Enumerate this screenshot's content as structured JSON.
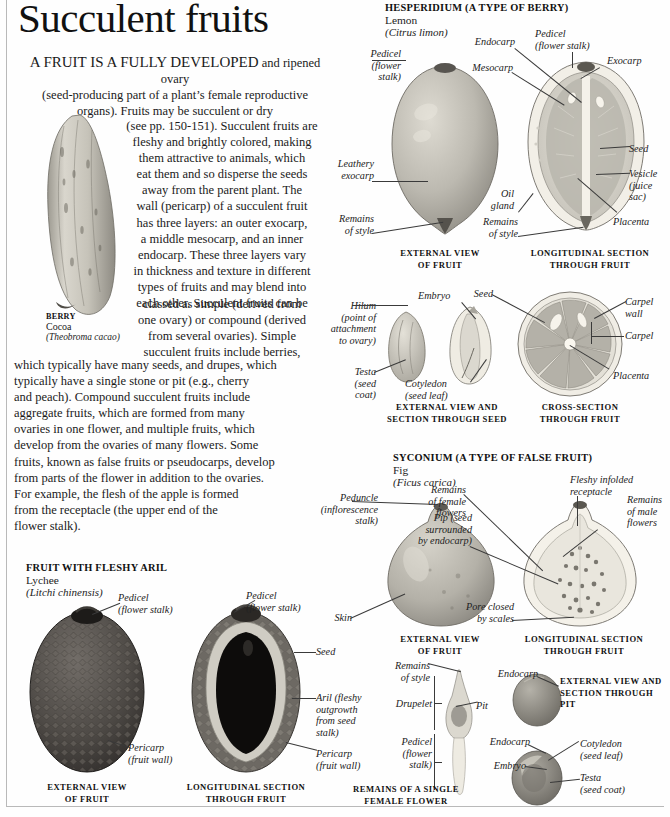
{
  "page": {
    "title": "Succulent fruits"
  },
  "intro": {
    "lead": "A FRUIT IS A FULLY DEVELOPED",
    "line1": "and ripened ovary",
    "line2": "(seed-producing part of a plant’s female reproductive",
    "line3": "organs). Fruits may be succulent or dry",
    "line4": "(see pp. 150-151). Succulent fruits are",
    "line5": "fleshy and brightly colored, making",
    "line6": "them attractive to animals, which",
    "line7": "eat them and so disperse the seeds",
    "line8": "away from the parent plant. The",
    "line9": "wall (pericarp) of a succulent fruit",
    "line10": "has three layers: an outer exocarp,",
    "line11": "a middle mesocarp, and an inner",
    "line12": "endocarp. These three layers vary",
    "line13": "in thickness and texture in different",
    "line14": "types of fruits and may blend into",
    "line15": "each other. Succulent fruits can be",
    "line16": "classed as simple (derived from",
    "line17": "one ovary) or compound (derived",
    "line18": "from several ovaries). Simple",
    "line19": "succulent fruits include berries,",
    "line20": "which typically have many seeds, and drupes, which",
    "line21": "typically have a single stone or pit (e.g., cherry",
    "line22": "and peach). Compound succulent fruits include",
    "line23": "aggregate fruits, which are formed from many",
    "line24": "ovaries in one flower, and multiple fruits, which",
    "line25": "develop from the ovaries of many flowers. Some",
    "line26": "fruits, known as false fruits or pseudocarps, develop",
    "line27": "from parts of the flower in addition to the ovaries.",
    "line28": "For example, the flesh of the apple is formed",
    "line29": "from the receptacle (the upper end of the",
    "line30": "flower stalk)."
  },
  "cocoa": {
    "head": "BERRY",
    "common": "Cocoa",
    "latin": "(Theobroma cacao)"
  },
  "hesperidium": {
    "head": "HESPERIDIUM (A TYPE OF BERRY)",
    "common": "Lemon",
    "latin": "(Citrus limon)",
    "labels": {
      "pedicel_left": "Pedicel\n(flower\nstalk)",
      "pedicel_left_l1": "Pedicel",
      "pedicel_left_l2": "(flower",
      "pedicel_left_l3": "stalk)",
      "leathery_l1": "Leathery",
      "leathery_l2": "exocarp",
      "remains_style_l1": "Remains",
      "remains_style_l2": "of style",
      "mesocarp": "Mesocarp",
      "endocarp": "Endocarp",
      "pedicel_top_l1": "Pedicel",
      "pedicel_top_l2": "(flower stalk)",
      "exocarp": "Exocarp",
      "seed": "Seed",
      "vesicle_l1": "Vesicle",
      "vesicle_l2": "(juice",
      "vesicle_l3": "sac)",
      "placenta": "Placenta",
      "oil_gland_l1": "Oil",
      "oil_gland_l2": "gland",
      "remains_style2_l1": "Remains",
      "remains_style2_l2": "of style"
    },
    "captions": {
      "external_l1": "EXTERNAL VIEW",
      "external_l2": "OF FRUIT",
      "longitudinal_l1": "LONGITUDINAL SECTION",
      "longitudinal_l2": "THROUGH FRUIT"
    }
  },
  "lemon_seed": {
    "labels": {
      "hilum_l1": "Hilum",
      "hilum_l2": "(point of",
      "hilum_l3": "attachment",
      "hilum_l4": "to ovary)",
      "testa_l1": "Testa",
      "testa_l2": "(seed",
      "testa_l3": "coat)",
      "embryo": "Embryo",
      "cotyledon_l1": "Cotyledon",
      "cotyledon_l2": "(seed leaf)",
      "seed": "Seed",
      "carpel_wall_l1": "Carpel",
      "carpel_wall_l2": "wall",
      "carpel": "Carpel",
      "placenta": "Placenta"
    },
    "captions": {
      "seed_l1": "EXTERNAL VIEW AND",
      "seed_l2": "SECTION THROUGH SEED",
      "cross_l1": "CROSS-SECTION",
      "cross_l2": "THROUGH FRUIT"
    }
  },
  "syconium": {
    "head": "SYCONIUM (A TYPE OF FALSE FRUIT)",
    "common": "Fig",
    "latin": "(Ficus carica)",
    "labels": {
      "peduncle_l1": "Peduncle",
      "peduncle_l2": "(inflorescence",
      "peduncle_l3": "stalk)",
      "skin": "Skin",
      "pip_l1": "Pip (seed",
      "pip_l2": "surrounded",
      "pip_l3": "by endocarp)",
      "remains_female_l1": "Remains",
      "remains_female_l2": "of female",
      "remains_female_l3": "flowers",
      "fleshy_l1": "Fleshy infolded",
      "fleshy_l2": "receptacle",
      "remains_male_l1": "Remains",
      "remains_male_l2": "of male",
      "remains_male_l3": "flowers",
      "pore_l1": "Pore closed",
      "pore_l2": "by scales"
    },
    "captions": {
      "external_l1": "EXTERNAL VIEW",
      "external_l2": "OF FRUIT",
      "longitudinal_l1": "LONGITUDINAL SECTION",
      "longitudinal_l2": "THROUGH FRUIT"
    }
  },
  "drupelet": {
    "labels": {
      "remains_style_l1": "Remains",
      "remains_style_l2": "of style",
      "drupelet": "Drupelet",
      "pit": "Pit",
      "pedicel_l1": "Pedicel",
      "pedicel_l2": "(flower",
      "pedicel_l3": "stalk)",
      "endocarp_top": "Endocarp",
      "endocarp_bottom": "Endocarp",
      "embryo": "Embryo",
      "cotyledon_l1": "Cotyledon",
      "cotyledon_l2": "(seed leaf)",
      "testa_l1": "Testa",
      "testa_l2": "(seed coat)"
    },
    "captions": {
      "single_l1": "REMAINS OF A SINGLE",
      "single_l2": "FEMALE FLOWER",
      "pit_l1": "EXTERNAL VIEW AND",
      "pit_l2": "SECTION THROUGH PIT"
    }
  },
  "lychee": {
    "head": "FRUIT WITH FLESHY ARIL",
    "common": "Lychee",
    "latin": "(Litchi chinensis)",
    "labels": {
      "pedicel_left_l1": "Pedicel",
      "pedicel_left_l2": "(flower stalk)",
      "pedicel_right_l1": "Pedicel",
      "pedicel_right_l2": "(flower stalk)",
      "skin": "Seed",
      "seed": "Seed",
      "aril_l1": "Aril (fleshy",
      "aril_l2": "outgrowth",
      "aril_l3": "from seed",
      "aril_l4": "stalk)",
      "pericarp_l1": "Pericarp",
      "pericarp_l2": "(fruit wall)",
      "pericarp2_l1": "Pericarp",
      "pericarp2_l2": "(fruit wall)"
    },
    "captions": {
      "external_l1": "EXTERNAL VIEW",
      "external_l2": "OF FRUIT",
      "longitudinal_l1": "LONGITUDINAL SECTION",
      "longitudinal_l2": "THROUGH FRUIT"
    }
  },
  "colors": {
    "ink": "#1a1a1a",
    "leader": "#3a3a3a",
    "frame": "#b9b9b9",
    "lemon_peel": "#b8b5ac",
    "lemon_flesh": "#d7d4cb",
    "fig_skin": "#b5b2a8",
    "lychee_skin": "#4a4542",
    "cocoa": "#c9c6bc"
  }
}
